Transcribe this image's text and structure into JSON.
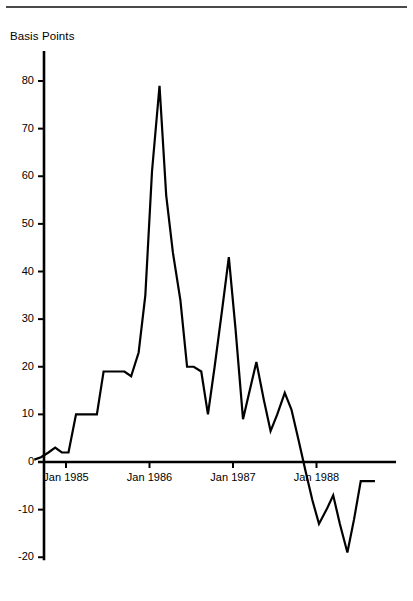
{
  "figure": {
    "axis_title": "Basis Points",
    "top_rule": true
  },
  "chart_data": {
    "type": "line",
    "title": "",
    "subtitle": "",
    "xlabel": "",
    "ylabel": "Basis Points",
    "ylim": [
      -20,
      80
    ],
    "xlim": [
      1984.55,
      1988.95
    ],
    "grid": false,
    "legend": null,
    "y_ticks": [
      -20,
      -10,
      0,
      10,
      20,
      30,
      40,
      50,
      60,
      70,
      80
    ],
    "y_tick_labels": [
      "-20",
      "-10",
      "0",
      "10",
      "20",
      "30",
      "40",
      "50",
      "60",
      "70",
      "80"
    ],
    "x_ticks": [
      1985.0,
      1986.0,
      1987.0,
      1988.0
    ],
    "x_tick_labels": [
      "Jan 1985",
      "Jan 1986",
      "Jan 1987",
      "Jan 1988"
    ],
    "series": [
      {
        "name": "Spread",
        "color": "#000000",
        "x": [
          1984.62,
          1984.7,
          1984.79,
          1984.87,
          1984.95,
          1985.03,
          1985.12,
          1985.2,
          1985.28,
          1985.37,
          1985.45,
          1985.53,
          1985.62,
          1985.7,
          1985.78,
          1985.87,
          1985.95,
          1986.03,
          1986.12,
          1986.2,
          1986.28,
          1986.37,
          1986.45,
          1986.53,
          1986.62,
          1986.7,
          1986.78,
          1986.87,
          1986.95,
          1987.03,
          1987.12,
          1987.2,
          1987.28,
          1987.37,
          1987.45,
          1987.53,
          1987.62,
          1987.7,
          1987.78,
          1987.87,
          1987.95,
          1988.03,
          1988.12,
          1988.2,
          1988.28,
          1988.37,
          1988.45,
          1988.53,
          1988.62,
          1988.7
        ],
        "values": [
          0.5,
          1.0,
          2.0,
          3.0,
          2.0,
          2.0,
          10.0,
          10.0,
          10.0,
          10.0,
          19.0,
          19.0,
          19.0,
          19.0,
          18.0,
          23.0,
          35.0,
          61.0,
          79.0,
          56.0,
          44.0,
          34.0,
          20.0,
          20.0,
          19.0,
          10.0,
          20.0,
          32.0,
          43.0,
          28.0,
          9.0,
          15.0,
          21.0,
          13.0,
          6.5,
          10.0,
          14.5,
          11.0,
          5.0,
          -2.0,
          -8.0,
          -13.0,
          -10.0,
          -7.0,
          -13.0,
          -19.0,
          -12.0,
          -4.0,
          -4.0,
          -4.0
        ]
      }
    ],
    "annotations": []
  }
}
